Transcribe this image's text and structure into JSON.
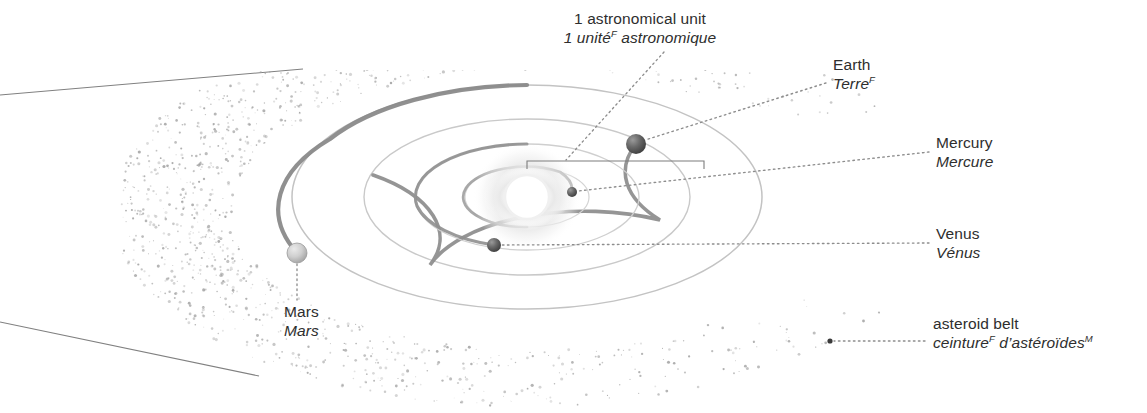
{
  "figure": {
    "colors": {
      "ink": "#2e2e2e",
      "orbit_light": "#b9b9b9",
      "orbit_dark": "#6e6e6e",
      "leader": "#8a8a8a",
      "asteroid": "#b0b0b0",
      "sun_glow": "#f2f2f2",
      "background": "#ffffff"
    }
  },
  "labels": {
    "au": {
      "en": "1 astronomical unit",
      "fr": "1 unité",
      "fr_sup": "F",
      "fr_rest": " astronomique"
    },
    "earth": {
      "en": "Earth",
      "fr": "Terre",
      "fr_sup": "F",
      "fr_rest": ""
    },
    "mercury": {
      "en": "Mercury",
      "fr": "Mercure",
      "fr_sup": "",
      "fr_rest": ""
    },
    "venus": {
      "en": "Venus",
      "fr": "Vénus",
      "fr_sup": "",
      "fr_rest": ""
    },
    "mars": {
      "en": "Mars",
      "fr": "Mars",
      "fr_sup": "",
      "fr_rest": ""
    },
    "asteroid_belt": {
      "en": "asteroid belt",
      "fr": "ceinture",
      "fr_sup": "F",
      "fr_rest": " d’astéroïdes",
      "fr_sup2": "M"
    }
  },
  "bodies": [
    {
      "name": "sun",
      "cx": 527,
      "cy": 197,
      "r": 26,
      "shade": "glow"
    },
    {
      "name": "mercury",
      "cx": 572,
      "cy": 192,
      "r": 5,
      "shade": "dark"
    },
    {
      "name": "venus",
      "cx": 494,
      "cy": 245,
      "r": 7,
      "shade": "dark"
    },
    {
      "name": "earth",
      "cx": 636,
      "cy": 144,
      "r": 10,
      "shade": "dark"
    },
    {
      "name": "mars",
      "cx": 297,
      "cy": 253,
      "r": 10,
      "shade": "light"
    }
  ],
  "orbits": [
    {
      "name": "mercury-orbit",
      "rx": 62,
      "ry": 30,
      "label": "Mercury orbit"
    },
    {
      "name": "venus-orbit",
      "rx": 112,
      "ry": 53,
      "label": "Venus orbit"
    },
    {
      "name": "earth-orbit",
      "rx": 163,
      "ry": 78,
      "label": "Earth orbit"
    },
    {
      "name": "mars-orbit",
      "rx": 235,
      "ry": 112,
      "label": "Mars orbit"
    }
  ],
  "au_bracket": {
    "x1": 527,
    "x2": 704,
    "y": 161,
    "tick": 8
  }
}
